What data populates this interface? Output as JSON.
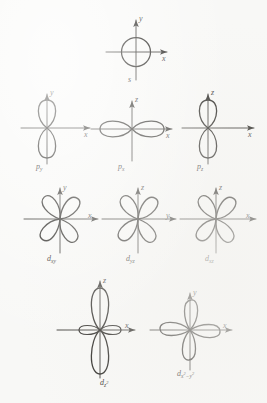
{
  "figure": {
    "background_color": "#f8f8f6",
    "ink_color": "#15130f",
    "rows": 4
  },
  "orbitals": [
    {
      "id": "s",
      "name": "s-orbital",
      "label": "s",
      "label_sub": "",
      "shape": "sphere",
      "axes": {
        "vertical": "y",
        "horizontal": "x"
      },
      "lobes": 0,
      "label_position": "below-center"
    },
    {
      "id": "py",
      "name": "p-y-orbital",
      "label": "p",
      "label_sub": "y",
      "shape": "dumbbell-vertical",
      "axes": {
        "vertical": "y",
        "horizontal": "x"
      },
      "lobes": 2,
      "label_position": "below-left"
    },
    {
      "id": "px",
      "name": "p-x-orbital",
      "label": "p",
      "label_sub": "x",
      "shape": "dumbbell-horizontal",
      "axes": {
        "vertical": "z",
        "horizontal": "x"
      },
      "lobes": 2,
      "label_position": "below-center"
    },
    {
      "id": "pz",
      "name": "p-z-orbital",
      "label": "p",
      "label_sub": "z",
      "shape": "dumbbell-vertical",
      "axes": {
        "vertical": "z",
        "horizontal": "x"
      },
      "lobes": 2,
      "label_position": "below-left"
    },
    {
      "id": "dxy",
      "name": "d-xy-orbital",
      "label": "d",
      "label_sub": "xy",
      "shape": "cloverleaf-diagonal",
      "axes": {
        "vertical": "y",
        "horizontal": "x"
      },
      "lobes": 4,
      "label_position": "below-center"
    },
    {
      "id": "dyz",
      "name": "d-yz-orbital",
      "label": "d",
      "label_sub": "yz",
      "shape": "cloverleaf-diagonal",
      "axes": {
        "vertical": "z",
        "horizontal": "y"
      },
      "lobes": 4,
      "label_position": "below-center"
    },
    {
      "id": "dxz",
      "name": "d-xz-orbital",
      "label": "d",
      "label_sub": "xz",
      "shape": "cloverleaf-diagonal",
      "axes": {
        "vertical": "z",
        "horizontal": "x"
      },
      "lobes": 4,
      "label_position": "below-center"
    },
    {
      "id": "dz2",
      "name": "d-z-squared-orbital",
      "label": "d",
      "label_sub": "z",
      "label_sub_sup": "2",
      "shape": "dumbbell-with-torus",
      "axes": {
        "vertical": "z",
        "horizontal": "x"
      },
      "lobes": 2,
      "label_position": "below-center"
    },
    {
      "id": "dx2y2",
      "name": "d-x-squared-minus-y-squared-orbital",
      "label": "d",
      "label_sub": "x",
      "label_sub_sup": "2",
      "label_sub_tail": "−y",
      "label_sub_sup2": "2",
      "shape": "cloverleaf-axial",
      "axes": {
        "vertical": "y",
        "horizontal": "x"
      },
      "lobes": 4,
      "label_position": "below-center"
    }
  ],
  "axis_labels": {
    "x": "x",
    "y": "y",
    "z": "z"
  }
}
